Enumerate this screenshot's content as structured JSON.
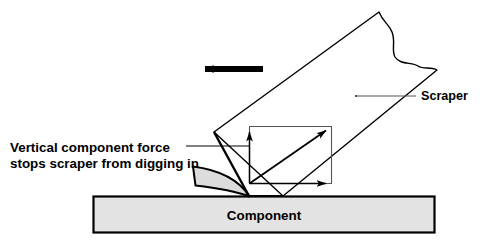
{
  "diagram": {
    "background_color": "#ffffff",
    "line_color": "#000000",
    "component_fill": "#e3e3e3",
    "chip_fill": "#dcdcdc",
    "vector_line_color": "#555555"
  },
  "labels": {
    "annotation_line1": "Vertical component force",
    "annotation_line2": "stops scraper from digging in",
    "scraper": "Scraper",
    "component": "Component"
  },
  "geometry": {
    "scraper_corners": "214,132 379,12 437,70 283,196",
    "scraper_torn_edge": "M 379,12 C 383,22 389,24 392,32 C 396,42 391,50 395,57 C 400,65 412,62 418,66 C 424,70 430,66 437,70",
    "component_rect": {
      "x": 93,
      "y": 196,
      "width": 342,
      "height": 37
    },
    "chip_curve": "M 193,167 L 196,185 C 214,187 236,191 249,196 C 240,184 223,171 193,167 Z",
    "force_box": {
      "x": 249,
      "y": 126,
      "width": 83,
      "height": 57
    },
    "origin_x": 249,
    "origin_y": 183,
    "vertical_arrow_tip_y": 126,
    "horizontal_arrow_tip_x": 332,
    "resultant_tip_x": 331,
    "resultant_tip_y": 126,
    "motion_arrow": {
      "x_start": 263,
      "x_end": 198,
      "y": 69
    },
    "annotation_leader": {
      "x_start": 186,
      "x_end": 249,
      "y": 146
    },
    "scraper_leader": {
      "x_start": 356,
      "x_end": 416,
      "y": 96
    }
  }
}
